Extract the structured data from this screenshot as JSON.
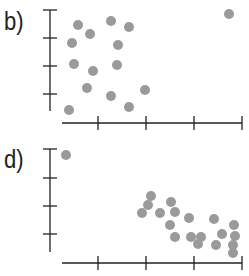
{
  "chart_data": [
    {
      "type": "scatter",
      "panel_label": "b)",
      "title": "",
      "xlabel": "",
      "ylabel": "",
      "x_ticks": 4,
      "y_ticks": 4,
      "tick_labels": "none",
      "grid": false,
      "marker_color": "#9a9a9a",
      "points_px": [
        [
          229,
          14
        ],
        [
          78,
          25
        ],
        [
          111,
          21
        ],
        [
          129,
          27
        ],
        [
          90,
          34
        ],
        [
          72,
          43
        ],
        [
          118,
          45
        ],
        [
          74,
          64
        ],
        [
          117,
          65
        ],
        [
          93,
          71
        ],
        [
          87,
          88
        ],
        [
          111,
          96
        ],
        [
          145,
          90
        ],
        [
          69,
          110
        ],
        [
          129,
          107
        ]
      ],
      "axes_px": {
        "y_axis_x": 50,
        "y_top": 10,
        "y_bottom": 111,
        "y_ticks": [
          10,
          38,
          66,
          94
        ],
        "x_axis_y": 123,
        "x_left": 62,
        "x_right": 242,
        "x_ticks": [
          98,
          146,
          194,
          242
        ]
      }
    },
    {
      "type": "scatter",
      "panel_label": "d)",
      "title": "",
      "xlabel": "",
      "ylabel": "",
      "x_ticks": 4,
      "y_ticks": 4,
      "tick_labels": "none",
      "grid": false,
      "marker_color": "#9a9a9a",
      "points_px": [
        [
          66,
          155
        ],
        [
          151,
          196
        ],
        [
          148,
          205
        ],
        [
          142,
          213
        ],
        [
          160,
          213
        ],
        [
          171,
          202
        ],
        [
          175,
          212
        ],
        [
          170,
          225
        ],
        [
          175,
          237
        ],
        [
          189,
          218
        ],
        [
          191,
          237
        ],
        [
          198,
          244
        ],
        [
          201,
          237
        ],
        [
          214,
          219
        ],
        [
          222,
          234
        ],
        [
          216,
          245
        ],
        [
          234,
          225
        ],
        [
          235,
          236
        ],
        [
          233,
          245
        ],
        [
          233,
          253
        ]
      ],
      "axes_px": {
        "y_axis_x": 50,
        "y_top": 149,
        "y_bottom": 252,
        "y_ticks": [
          149,
          178,
          206,
          234
        ],
        "x_axis_y": 263,
        "x_left": 62,
        "x_right": 242,
        "x_ticks": [
          98,
          146,
          194,
          242
        ]
      }
    }
  ]
}
